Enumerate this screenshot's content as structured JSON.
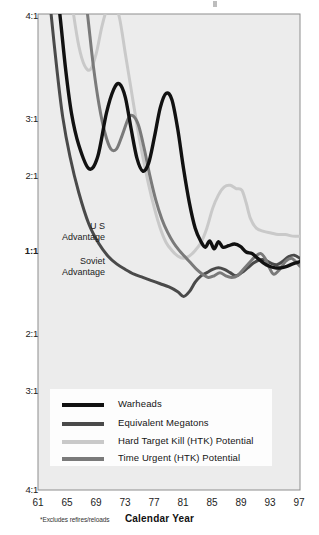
{
  "chart_data": {
    "type": "line",
    "title": "",
    "xlabel": "Calendar Year",
    "ylabel": "",
    "footnote": "*Excludes refires/reloads",
    "grid": false,
    "legend_position": "bottom-center",
    "x_ticks": [
      "61",
      "65",
      "69",
      "73",
      "77",
      "81",
      "85",
      "89",
      "93",
      "97"
    ],
    "y_ticks": [
      "4:1",
      "3:1",
      "2:1",
      "1:1",
      "2:1",
      "3:1",
      "4:1"
    ],
    "y_axis_note": "Ratio axis is symmetric about 1:1; upper half is US advantage, lower half is Soviet advantage",
    "xlim": [
      61,
      97
    ],
    "ylim": [
      -4,
      4
    ],
    "region_labels": [
      {
        "name": "us-advantage",
        "line1": "U S",
        "line2": "Advantage"
      },
      {
        "name": "soviet-advantage",
        "line1": "Soviet",
        "line2": "Advantage"
      }
    ],
    "colors": {
      "warheads": "#111111",
      "equivalent_megatons": "#4a4a4a",
      "hard_target_kill": "#c9c9c9",
      "time_urgent_htk": "#7a7a7a",
      "plot_background": "#ececec",
      "plot_border": "#8e8e8e",
      "page_background": "#ffffff"
    },
    "series": [
      {
        "name": "Warheads",
        "color": "#111111",
        "points": [
          [
            63.2,
            4.6
          ],
          [
            64.0,
            4.0
          ],
          [
            64.8,
            3.3
          ],
          [
            65.6,
            2.75
          ],
          [
            66.6,
            2.35
          ],
          [
            68.0,
            2.05
          ],
          [
            69.2,
            2.2
          ],
          [
            70.4,
            2.75
          ],
          [
            71.4,
            3.05
          ],
          [
            72.2,
            3.12
          ],
          [
            73.0,
            2.95
          ],
          [
            73.8,
            2.55
          ],
          [
            74.6,
            2.18
          ],
          [
            75.4,
            2.02
          ],
          [
            76.2,
            2.12
          ],
          [
            77.0,
            2.45
          ],
          [
            77.8,
            2.82
          ],
          [
            78.6,
            3.0
          ],
          [
            79.4,
            2.92
          ],
          [
            80.2,
            2.55
          ],
          [
            81.0,
            2.05
          ],
          [
            81.8,
            1.62
          ],
          [
            82.6,
            1.3
          ],
          [
            83.4,
            1.13
          ],
          [
            84.0,
            1.06
          ],
          [
            84.6,
            1.14
          ],
          [
            85.2,
            1.04
          ],
          [
            85.8,
            1.13
          ],
          [
            86.4,
            1.06
          ],
          [
            87.2,
            1.08
          ],
          [
            88.0,
            1.1
          ],
          [
            88.8,
            1.07
          ],
          [
            89.6,
            1.0
          ],
          [
            90.4,
            -1.02
          ],
          [
            91.2,
            -1.08
          ],
          [
            92.0,
            -1.14
          ],
          [
            92.8,
            -1.18
          ],
          [
            93.6,
            -1.2
          ],
          [
            94.4,
            -1.2
          ],
          [
            95.2,
            -1.18
          ],
          [
            96.0,
            -1.15
          ],
          [
            97.0,
            -1.12
          ]
        ]
      },
      {
        "name": "Equivalent Megatons",
        "color": "#4a4a4a",
        "points": [
          [
            62.2,
            4.6
          ],
          [
            62.8,
            4.0
          ],
          [
            63.6,
            3.3
          ],
          [
            64.4,
            2.7
          ],
          [
            65.4,
            2.2
          ],
          [
            66.6,
            1.75
          ],
          [
            68.0,
            1.35
          ],
          [
            69.4,
            1.1
          ],
          [
            70.6,
            -1.05
          ],
          [
            71.8,
            -1.15
          ],
          [
            73.0,
            -1.22
          ],
          [
            74.2,
            -1.28
          ],
          [
            75.4,
            -1.32
          ],
          [
            76.6,
            -1.36
          ],
          [
            77.8,
            -1.4
          ],
          [
            79.0,
            -1.44
          ],
          [
            80.2,
            -1.5
          ],
          [
            81.0,
            -1.56
          ],
          [
            81.8,
            -1.5
          ],
          [
            82.6,
            -1.38
          ],
          [
            83.4,
            -1.3
          ],
          [
            84.2,
            -1.26
          ],
          [
            85.0,
            -1.22
          ],
          [
            85.8,
            -1.2
          ],
          [
            86.6,
            -1.22
          ],
          [
            87.4,
            -1.26
          ],
          [
            88.2,
            -1.3
          ],
          [
            89.0,
            -1.26
          ],
          [
            89.8,
            -1.2
          ],
          [
            90.6,
            -1.14
          ],
          [
            91.4,
            -1.1
          ],
          [
            92.2,
            -1.1
          ],
          [
            93.0,
            -1.14
          ],
          [
            93.8,
            -1.16
          ],
          [
            94.6,
            -1.12
          ],
          [
            95.4,
            -1.06
          ],
          [
            96.2,
            -1.04
          ],
          [
            97.0,
            -1.08
          ]
        ]
      },
      {
        "name": "Hard Target Kill (HTK) Potential",
        "color": "#c9c9c9",
        "points": [
          [
            65.0,
            4.6
          ],
          [
            65.8,
            4.05
          ],
          [
            66.6,
            3.6
          ],
          [
            67.4,
            3.35
          ],
          [
            68.2,
            3.3
          ],
          [
            69.0,
            3.5
          ],
          [
            69.8,
            3.85
          ],
          [
            70.6,
            4.1
          ],
          [
            71.4,
            4.15
          ],
          [
            72.2,
            3.95
          ],
          [
            73.0,
            3.5
          ],
          [
            73.8,
            3.05
          ],
          [
            74.6,
            2.6
          ],
          [
            75.4,
            2.2
          ],
          [
            76.2,
            1.85
          ],
          [
            77.0,
            1.55
          ],
          [
            77.8,
            1.3
          ],
          [
            78.6,
            1.12
          ],
          [
            79.4,
            1.02
          ],
          [
            80.2,
            -1.05
          ],
          [
            81.0,
            -1.08
          ],
          [
            81.8,
            -1.05
          ],
          [
            82.6,
            1.02
          ],
          [
            83.4,
            1.12
          ],
          [
            84.2,
            1.3
          ],
          [
            85.0,
            1.55
          ],
          [
            85.8,
            1.72
          ],
          [
            86.6,
            1.82
          ],
          [
            87.4,
            1.84
          ],
          [
            88.2,
            1.8
          ],
          [
            89.0,
            1.78
          ],
          [
            89.6,
            1.62
          ],
          [
            90.2,
            1.42
          ],
          [
            91.0,
            1.3
          ],
          [
            92.0,
            1.26
          ],
          [
            93.0,
            1.24
          ],
          [
            94.0,
            1.22
          ],
          [
            95.0,
            1.22
          ],
          [
            96.0,
            1.2
          ],
          [
            97.0,
            1.2
          ]
        ]
      },
      {
        "name": "Time Urgent (HTK) Potential",
        "color": "#7a7a7a",
        "points": [
          [
            67.0,
            4.6
          ],
          [
            67.8,
            4.0
          ],
          [
            68.6,
            3.35
          ],
          [
            69.4,
            2.85
          ],
          [
            70.2,
            2.5
          ],
          [
            71.0,
            2.3
          ],
          [
            71.8,
            2.3
          ],
          [
            72.6,
            2.48
          ],
          [
            73.4,
            2.68
          ],
          [
            74.0,
            2.72
          ],
          [
            74.8,
            2.6
          ],
          [
            75.6,
            2.3
          ],
          [
            76.4,
            1.95
          ],
          [
            77.2,
            1.65
          ],
          [
            78.0,
            1.42
          ],
          [
            78.8,
            1.25
          ],
          [
            79.6,
            1.12
          ],
          [
            80.4,
            1.02
          ],
          [
            81.2,
            -1.06
          ],
          [
            82.0,
            -1.14
          ],
          [
            82.8,
            -1.22
          ],
          [
            83.6,
            -1.28
          ],
          [
            84.4,
            -1.32
          ],
          [
            85.2,
            -1.3
          ],
          [
            86.0,
            -1.26
          ],
          [
            86.8,
            -1.3
          ],
          [
            87.6,
            -1.32
          ],
          [
            88.4,
            -1.3
          ],
          [
            89.2,
            -1.22
          ],
          [
            90.0,
            -1.14
          ],
          [
            90.8,
            -1.06
          ],
          [
            91.6,
            -1.02
          ],
          [
            92.2,
            -1.08
          ],
          [
            92.8,
            -1.2
          ],
          [
            93.4,
            -1.28
          ],
          [
            94.2,
            -1.22
          ],
          [
            95.0,
            -1.12
          ],
          [
            95.8,
            -1.08
          ],
          [
            96.4,
            -1.12
          ],
          [
            97.0,
            -1.18
          ]
        ]
      }
    ]
  },
  "legend": {
    "items": [
      {
        "label": "Warheads",
        "color": "#111111",
        "weight": 5
      },
      {
        "label": "Equivalent Megatons",
        "color": "#4a4a4a",
        "weight": 5
      },
      {
        "label": "Hard Target Kill (HTK)  Potential",
        "color": "#c9c9c9",
        "weight": 5
      },
      {
        "label": "Time Urgent (HTK) Potential",
        "color": "#7a7a7a",
        "weight": 5
      }
    ]
  },
  "axis": {
    "x_title": "Calendar Year",
    "footnote": "*Excludes refires/reloads"
  }
}
